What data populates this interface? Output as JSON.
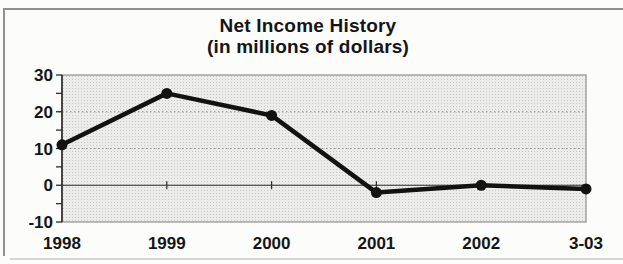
{
  "page": {
    "frame_color": "#8f8f8f"
  },
  "chart_data": {
    "type": "line",
    "title": "Net Income History",
    "subtitle": "(in millions of dollars)",
    "categories": [
      "1998",
      "1999",
      "2000",
      "2001",
      "2002",
      "3-03"
    ],
    "values": [
      11,
      25,
      19,
      -2,
      0,
      -1
    ],
    "xlabel": "",
    "ylabel": "",
    "ylim": [
      -10,
      30
    ],
    "yticks_major": [
      30,
      20,
      10,
      0,
      -10
    ],
    "yticks_minor": [
      25,
      15,
      5,
      -5
    ],
    "grid_values": [
      20,
      10
    ],
    "axis_crosses_at": 0,
    "grid": "dotted",
    "legend": "none",
    "colors": {
      "line": "#121212",
      "marker": "#121212",
      "plot_fill": "#ececea",
      "plot_dot": "#c6c6c4",
      "grid": "#8f8f8f",
      "axis": "#2a2a2a",
      "border": "#8f8f8f",
      "text": "#151515"
    }
  }
}
